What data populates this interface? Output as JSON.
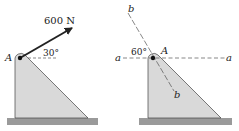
{
  "figures": [
    {
      "id": "left",
      "force_label": "600 N",
      "angle_label": "30°",
      "point_label": "A"
    },
    {
      "id": "right",
      "angle_label": "60°",
      "point_label": "A",
      "axis_a_left": "a",
      "axis_a_right": "a",
      "axis_b_top": "b",
      "axis_b_bottom": "b"
    }
  ],
  "colors": {
    "bracket_fill": "#d9d9d9",
    "ground_fill": "#9a9a9a",
    "line": "#222222"
  }
}
